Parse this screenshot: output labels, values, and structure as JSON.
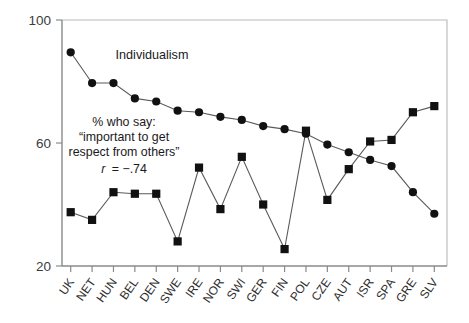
{
  "chart_data": {
    "type": "line",
    "title": "",
    "xlabel": "",
    "ylabel": "",
    "ylim": [
      20,
      100
    ],
    "yticks": [
      20,
      60,
      100
    ],
    "ytick_labels": [
      "20",
      "60",
      "100"
    ],
    "grid": false,
    "legend": "none",
    "categories": [
      "UK",
      "NET",
      "HUN",
      "BEL",
      "DEN",
      "SWE",
      "IRE",
      "NOR",
      "SWI",
      "GER",
      "FIN",
      "POL",
      "CZE",
      "AUT",
      "ISR",
      "SPA",
      "GRE",
      "SLV"
    ],
    "series": [
      {
        "name": "Individualism",
        "marker": "circle",
        "values": [
          89.5,
          79.5,
          79.5,
          74.5,
          73.5,
          70.5,
          70.0,
          68.5,
          67.5,
          65.5,
          64.5,
          63.0,
          59.5,
          57.0,
          54.5,
          52.5,
          44.0,
          37.0
        ]
      },
      {
        "name": "% who say: \"important to get respect from others\"",
        "marker": "square",
        "values": [
          37.5,
          35.0,
          44.0,
          43.5,
          43.5,
          28.0,
          52.0,
          38.5,
          55.5,
          40.0,
          25.5,
          64.0,
          41.5,
          51.5,
          60.5,
          61.0,
          70.0,
          72.0
        ]
      }
    ],
    "annotations": {
      "series_label": "Individualism",
      "note_line1": "% who say:",
      "note_line2": "“important to get",
      "note_line3": "respect from others”",
      "correlation_prefix": "r",
      "correlation_value": "= −.74"
    },
    "colors": {
      "marker": "#111111",
      "line": "#5a5a5a",
      "axis": "#8a8a8a",
      "frame": "#b9b9b9",
      "text": "#1a1a1a"
    }
  }
}
